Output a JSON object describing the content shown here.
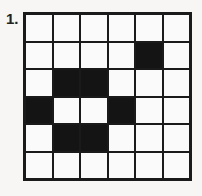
{
  "problem": {
    "number_label": "1.",
    "grid": {
      "rows": 6,
      "cols": 6,
      "filled_color": "#141414",
      "empty_color": "#fafafa",
      "cells": [
        [
          0,
          0,
          0,
          0,
          0,
          0
        ],
        [
          0,
          0,
          0,
          0,
          1,
          0
        ],
        [
          0,
          1,
          1,
          0,
          0,
          0
        ],
        [
          1,
          0,
          0,
          1,
          0,
          0
        ],
        [
          0,
          1,
          1,
          0,
          0,
          0
        ],
        [
          0,
          0,
          0,
          0,
          0,
          0
        ]
      ]
    }
  }
}
